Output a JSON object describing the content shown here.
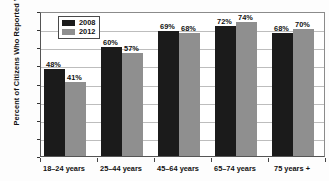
{
  "chart_data": {
    "type": "bar",
    "title": "",
    "xlabel": "",
    "ylabel": "Percent of Citizens Who Reported Voting",
    "ylim": [
      0,
      80
    ],
    "ytick_step": 10,
    "yticks": [
      "80",
      "70",
      "60",
      "50",
      "40",
      "30",
      "20",
      "10",
      "0"
    ],
    "grid": true,
    "legend_position": "upper-left-inside",
    "categories": [
      "18–24 years",
      "25–44 years",
      "45–64 years",
      "65–74 years",
      "75 years +"
    ],
    "series": [
      {
        "name": "2008",
        "color": "#1b1b1b",
        "values": [
          48,
          60,
          69,
          72,
          68
        ],
        "labels": [
          "48%",
          "60%",
          "69%",
          "72%",
          "68%"
        ]
      },
      {
        "name": "2012",
        "color": "#8f8f8f",
        "values": [
          41,
          57,
          68,
          74,
          70
        ],
        "labels": [
          "41%",
          "57%",
          "68%",
          "74%",
          "70%"
        ]
      }
    ]
  },
  "legend": {
    "entries": [
      {
        "label": "2008",
        "swatch": "#1b1b1b"
      },
      {
        "label": "2012",
        "swatch": "#8f8f8f"
      }
    ]
  },
  "colors": {
    "series_2008": "#1b1b1b",
    "series_2012": "#8f8f8f",
    "gridline": "#bdbdbd",
    "axis": "#555555",
    "text": "#111111",
    "background": "#ffffff"
  },
  "cropped_title_remnant": ""
}
